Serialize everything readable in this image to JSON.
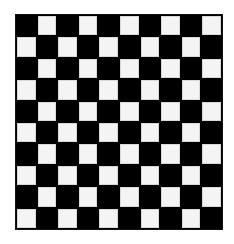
{
  "board": {
    "rows": 10,
    "cols": 10,
    "top_left": "dark",
    "colors": {
      "dark": "#000000",
      "light": "#f4f4f4"
    }
  }
}
